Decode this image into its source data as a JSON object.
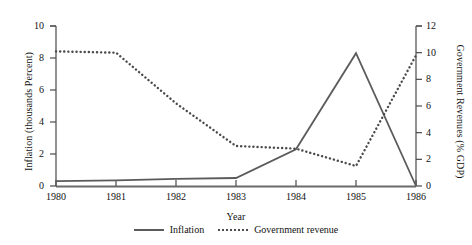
{
  "chart_data": {
    "type": "line",
    "title": "",
    "xlabel": "Year",
    "categories": [
      "1980",
      "1981",
      "1982",
      "1983",
      "1984",
      "1985",
      "1986"
    ],
    "x_ticks": [
      "1980",
      "1981",
      "1982",
      "1983",
      "1984",
      "1985",
      "1986"
    ],
    "grid": false,
    "legend_position": "bottom",
    "axes": {
      "left": {
        "label": "Inflation (thousands Percent)",
        "ticks": [
          "0",
          "2",
          "4",
          "6",
          "8",
          "10"
        ],
        "tick_values": [
          0,
          2,
          4,
          6,
          8,
          10
        ],
        "ylim": [
          0,
          10
        ]
      },
      "right": {
        "label": "Government Revenues (% GDP)",
        "ticks": [
          "0",
          "2",
          "4",
          "6",
          "8",
          "10",
          "12"
        ],
        "tick_values": [
          0,
          2,
          4,
          6,
          8,
          10,
          12
        ],
        "ylim": [
          0,
          12
        ]
      }
    },
    "series": [
      {
        "name": "Inflation",
        "axis": "left",
        "style": "solid",
        "color": "#5b5b5b",
        "values": [
          0.3,
          0.35,
          0.45,
          0.5,
          2.3,
          8.3,
          0.0
        ]
      },
      {
        "name": "Government revenue",
        "axis": "right",
        "style": "dotted",
        "color": "#4a4a4a",
        "values": [
          10.1,
          10.0,
          6.2,
          3.0,
          2.8,
          1.5,
          9.8
        ]
      }
    ]
  },
  "legend": {
    "items": [
      {
        "label": "Inflation",
        "style": "solid"
      },
      {
        "label": "Government revenue",
        "style": "dotted"
      }
    ]
  }
}
